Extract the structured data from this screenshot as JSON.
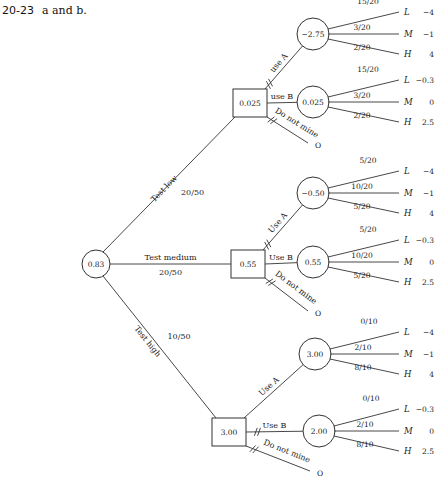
{
  "heading": {
    "number": "20-23",
    "text": "a and b."
  },
  "root": {
    "value": "0.83"
  },
  "tests": [
    {
      "label": "Test low",
      "prob": "20/50",
      "decision_value": "0.025",
      "options": [
        {
          "label": "use A",
          "chance_value": "−2.75",
          "outcomes": [
            {
              "prob": "15/20",
              "state": "L",
              "payoff": "−4"
            },
            {
              "prob": "3/20",
              "state": "M",
              "payoff": "−1"
            },
            {
              "prob": "2/20",
              "state": "H",
              "payoff": "4"
            }
          ]
        },
        {
          "label": "use B",
          "chance_value": "0.025",
          "outcomes": [
            {
              "prob": "15/20",
              "state": "L",
              "payoff": "−0.3"
            },
            {
              "prob": "3/20",
              "state": "M",
              "payoff": "0"
            },
            {
              "prob": "2/20",
              "state": "H",
              "payoff": "2.5"
            }
          ]
        },
        {
          "label": "Do not mine",
          "payoff": "O"
        }
      ]
    },
    {
      "label": "Test medium",
      "prob": "20/50",
      "decision_value": "0.55",
      "options": [
        {
          "label": "Use A",
          "chance_value": "−0.50",
          "outcomes": [
            {
              "prob": "5/20",
              "state": "L",
              "payoff": "−4"
            },
            {
              "prob": "10/20",
              "state": "M",
              "payoff": "−1"
            },
            {
              "prob": "5/20",
              "state": "H",
              "payoff": "4"
            }
          ]
        },
        {
          "label": "Use B",
          "chance_value": "0.55",
          "outcomes": [
            {
              "prob": "5/20",
              "state": "L",
              "payoff": "−0.3"
            },
            {
              "prob": "10/20",
              "state": "M",
              "payoff": "0"
            },
            {
              "prob": "5/20",
              "state": "H",
              "payoff": "2.5"
            }
          ]
        },
        {
          "label": "Do not mine",
          "payoff": "O"
        }
      ]
    },
    {
      "label": "Test high",
      "prob": "10/50",
      "decision_value": "3.00",
      "options": [
        {
          "label": "Use A",
          "chance_value": "3.00",
          "outcomes": [
            {
              "prob": "0/10",
              "state": "L",
              "payoff": "−4"
            },
            {
              "prob": "2/10",
              "state": "M",
              "payoff": "−1"
            },
            {
              "prob": "8/10",
              "state": "H",
              "payoff": "4"
            }
          ]
        },
        {
          "label": "Use B",
          "chance_value": "2.00",
          "outcomes": [
            {
              "prob": "0/10",
              "state": "L",
              "payoff": "−0.3"
            },
            {
              "prob": "2/10",
              "state": "M",
              "payoff": "0"
            },
            {
              "prob": "8/10",
              "state": "H",
              "payoff": "2.5"
            }
          ]
        },
        {
          "label": "Do not mine",
          "payoff": "O"
        }
      ]
    }
  ]
}
